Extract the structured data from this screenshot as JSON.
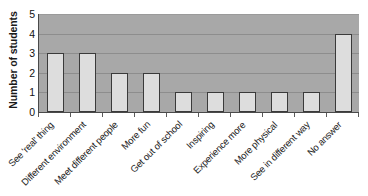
{
  "chart_data": {
    "type": "bar",
    "title": "",
    "xlabel": "",
    "ylabel": "Number of students",
    "ylim": [
      0,
      5
    ],
    "ytick_labels": [
      "5",
      "4",
      "3",
      "2",
      "1",
      "0"
    ],
    "yticks": [
      5,
      4,
      3,
      2,
      1,
      0
    ],
    "grid": true,
    "legend": "none",
    "categories": [
      "See 'real' thing",
      "Different environment",
      "Meet different people",
      "More fun",
      "Get out of school",
      "Inspiring",
      "Experience more",
      "More physical",
      "See in different way",
      "No answer"
    ],
    "values": [
      3,
      3,
      2,
      2,
      1,
      1,
      1,
      1,
      1,
      4
    ],
    "colors": {
      "bar_fill": "#dddddd",
      "bar_outline": "#3a3a3a",
      "plot_background": "#a8a8a8",
      "gridline": "#8d8d8d",
      "axis": "#4a4a4a",
      "text": "#1c1c1c",
      "page_background": "#ffffff"
    }
  }
}
